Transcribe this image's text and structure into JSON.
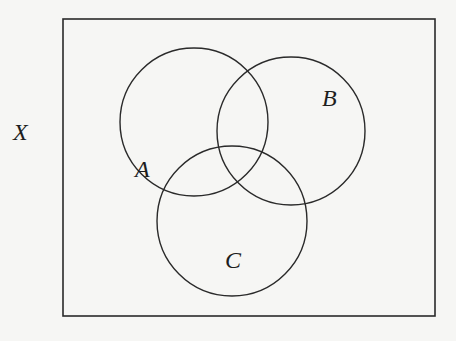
{
  "diagram": {
    "type": "venn",
    "universe": {
      "label": "X",
      "rect": {
        "x": 63,
        "y": 19,
        "width": 372,
        "height": 297
      }
    },
    "sets": [
      {
        "name": "A",
        "cx": 194,
        "cy": 122,
        "r": 74,
        "label_pos": {
          "x": 144,
          "y": 168
        }
      },
      {
        "name": "B",
        "cx": 291,
        "cy": 131,
        "r": 74,
        "label_pos": {
          "x": 330,
          "y": 107
        }
      },
      {
        "name": "C",
        "cx": 232,
        "cy": 221,
        "r": 75,
        "label_pos": {
          "x": 233,
          "y": 269
        }
      }
    ],
    "colors": {
      "stroke": "#2a2a2a",
      "background": "#f6f6f4"
    }
  },
  "labels": {
    "universe": "X",
    "set_a": "A",
    "set_b": "B",
    "set_c": "C"
  }
}
